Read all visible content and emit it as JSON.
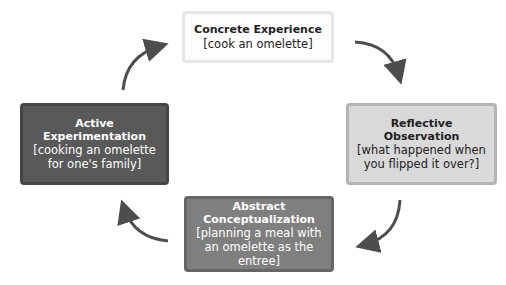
{
  "diagram": {
    "type": "cycle",
    "direction": "clockwise",
    "nodes": [
      {
        "id": "concrete",
        "title": "Concrete Experience",
        "subtitle": "[cook an omelette]",
        "fill": "#fdfdfd",
        "border": "#e6e6e6",
        "text_color": "#222222"
      },
      {
        "id": "reflective",
        "title": "Reflective Observation",
        "subtitle": "[what happened when you flipped it over?]",
        "fill": "#d9d9d9",
        "border": "#b3b3b3",
        "text_color": "#222222"
      },
      {
        "id": "abstract",
        "title": "Abstract Conceptualization",
        "subtitle": "[planning a meal with an omelette as the entree]",
        "fill": "#7f7f7f",
        "border": "#666666",
        "text_color": "#ffffff"
      },
      {
        "id": "active",
        "title": "Active Experimentation",
        "subtitle": "[cooking an omelette for one's family]",
        "fill": "#595959",
        "border": "#444444",
        "text_color": "#ffffff"
      }
    ],
    "edges": [
      {
        "from": "concrete",
        "to": "reflective"
      },
      {
        "from": "reflective",
        "to": "abstract"
      },
      {
        "from": "abstract",
        "to": "active"
      },
      {
        "from": "active",
        "to": "concrete"
      }
    ],
    "arrow_color": "#4d4d4d"
  }
}
